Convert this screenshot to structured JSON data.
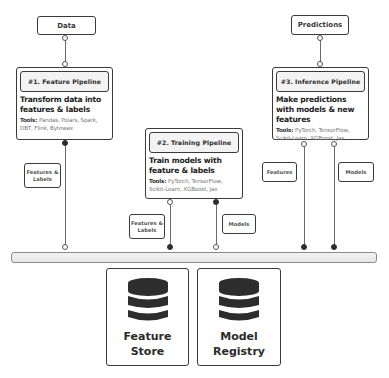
{
  "inputs": {
    "data_label": "Data",
    "predictions_label": "Predictions"
  },
  "pipelines": [
    {
      "title": "#1. Feature Pipeline",
      "description": "Transform data into features & labels",
      "tools_label": "Tools:",
      "tools": "Pandas, Polars, Spark, DBT, Flink, Bytewax"
    },
    {
      "title": "#2. Training Pipeline",
      "description": "Train models with feature & labels",
      "tools_label": "Tools:",
      "tools": "PyTorch, TensorFlow, Scikit-Learn, XGBoost, Jax"
    },
    {
      "title": "#3. Inference Pipeline",
      "description": "Make predictions with models & new features",
      "tools_label": "Tools:",
      "tools": "PyTorch, TensorFlow, Scikit-Learn, XGBoost, Jax"
    }
  ],
  "edge_labels": {
    "feature_pipeline_out": "Features & Labels",
    "training_in": "Features & Labels",
    "training_out": "Models",
    "inference_features_in": "Features",
    "inference_models_in": "Models"
  },
  "stores": [
    {
      "title": "Feature Store",
      "icon": "database-icon"
    },
    {
      "title": "Model Registry",
      "icon": "database-icon"
    }
  ],
  "colors": {
    "stroke": "#3a3a3a",
    "header_fill": "#f3f3f3",
    "bus_fill": "#ececec",
    "icon_fill": "#2d2d2d"
  }
}
